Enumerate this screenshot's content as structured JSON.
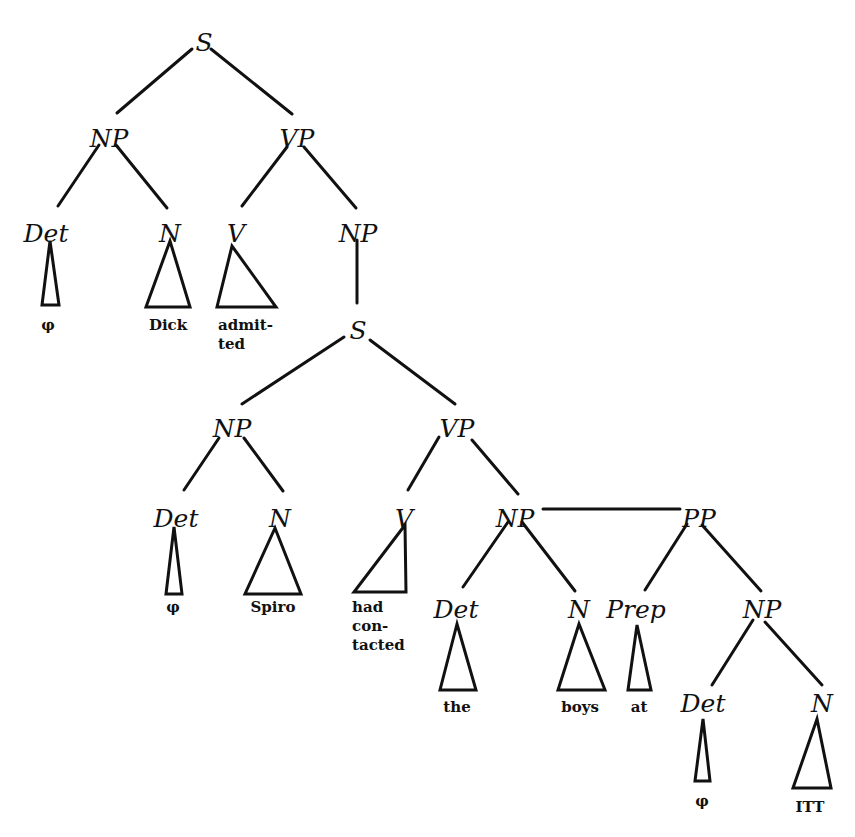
{
  "diagram": {
    "type": "syntax-tree",
    "sentence": "Dick admitted Spiro had contacted the boys at ITT",
    "colors": {
      "ink": "#111111",
      "background": "#ffffff"
    },
    "nodes": [
      {
        "id": "s1",
        "label": "S",
        "x": 204,
        "y": 42
      },
      {
        "id": "np1",
        "label": "NP",
        "x": 109,
        "y": 138
      },
      {
        "id": "vp1",
        "label": "VP",
        "x": 297,
        "y": 138
      },
      {
        "id": "det1",
        "label": "Det",
        "x": 46,
        "y": 233
      },
      {
        "id": "n1",
        "label": "N",
        "x": 170,
        "y": 233
      },
      {
        "id": "v1",
        "label": "V",
        "x": 236,
        "y": 233
      },
      {
        "id": "np2",
        "label": "NP",
        "x": 358,
        "y": 233
      },
      {
        "id": "s2",
        "label": "S",
        "x": 358,
        "y": 330
      },
      {
        "id": "np3",
        "label": "NP",
        "x": 232,
        "y": 428
      },
      {
        "id": "vp2",
        "label": "VP",
        "x": 457,
        "y": 428
      },
      {
        "id": "det2",
        "label": "Det",
        "x": 176,
        "y": 518
      },
      {
        "id": "n2",
        "label": "N",
        "x": 280,
        "y": 518
      },
      {
        "id": "v2",
        "label": "V",
        "x": 404,
        "y": 518
      },
      {
        "id": "np4",
        "label": "NP",
        "x": 515,
        "y": 518
      },
      {
        "id": "pp1",
        "label": "PP",
        "x": 699,
        "y": 518
      },
      {
        "id": "det3",
        "label": "Det",
        "x": 456,
        "y": 609
      },
      {
        "id": "n3",
        "label": "N",
        "x": 579,
        "y": 609
      },
      {
        "id": "prep1",
        "label": "Prep",
        "x": 636,
        "y": 609
      },
      {
        "id": "np5",
        "label": "NP",
        "x": 762,
        "y": 609
      },
      {
        "id": "det4",
        "label": "Det",
        "x": 703,
        "y": 703
      },
      {
        "id": "n4",
        "label": "N",
        "x": 822,
        "y": 703
      }
    ],
    "edges": [
      {
        "from": "s1",
        "to": "np1",
        "x1": 192,
        "y1": 49,
        "x2": 117,
        "y2": 113
      },
      {
        "from": "s1",
        "to": "vp1",
        "x1": 211,
        "y1": 49,
        "x2": 292,
        "y2": 114
      },
      {
        "from": "np1",
        "to": "det1",
        "x1": 99,
        "y1": 145,
        "x2": 58,
        "y2": 206
      },
      {
        "from": "np1",
        "to": "n1",
        "x1": 116,
        "y1": 145,
        "x2": 167,
        "y2": 208
      },
      {
        "from": "vp1",
        "to": "v1",
        "x1": 287,
        "y1": 147,
        "x2": 242,
        "y2": 206
      },
      {
        "from": "vp1",
        "to": "np2",
        "x1": 304,
        "y1": 147,
        "x2": 356,
        "y2": 208
      },
      {
        "from": "np2",
        "to": "s2",
        "x1": 357,
        "y1": 240,
        "x2": 357,
        "y2": 303
      },
      {
        "from": "s2",
        "to": "np3",
        "x1": 344,
        "y1": 337,
        "x2": 242,
        "y2": 404
      },
      {
        "from": "s2",
        "to": "vp2",
        "x1": 370,
        "y1": 340,
        "x2": 455,
        "y2": 404
      },
      {
        "from": "np3",
        "to": "det2",
        "x1": 219,
        "y1": 438,
        "x2": 184,
        "y2": 490
      },
      {
        "from": "np3",
        "to": "n2",
        "x1": 244,
        "y1": 438,
        "x2": 283,
        "y2": 491
      },
      {
        "from": "vp2",
        "to": "v2",
        "x1": 439,
        "y1": 437,
        "x2": 408,
        "y2": 490
      },
      {
        "from": "vp2",
        "to": "np4",
        "x1": 472,
        "y1": 440,
        "x2": 518,
        "y2": 494
      },
      {
        "from": "np4",
        "to": "pp1",
        "x1": 543,
        "y1": 509,
        "x2": 680,
        "y2": 509
      },
      {
        "from": "np4",
        "to": "det3",
        "x1": 508,
        "y1": 522,
        "x2": 463,
        "y2": 587
      },
      {
        "from": "np4",
        "to": "n3",
        "x1": 522,
        "y1": 522,
        "x2": 575,
        "y2": 591
      },
      {
        "from": "pp1",
        "to": "prep1",
        "x1": 687,
        "y1": 524,
        "x2": 645,
        "y2": 590
      },
      {
        "from": "pp1",
        "to": "np5",
        "x1": 702,
        "y1": 525,
        "x2": 761,
        "y2": 591
      },
      {
        "from": "np5",
        "to": "det4",
        "x1": 753,
        "y1": 620,
        "x2": 712,
        "y2": 685
      },
      {
        "from": "np5",
        "to": "n4",
        "x1": 765,
        "y1": 622,
        "x2": 822,
        "y2": 685
      }
    ],
    "leaves": [
      {
        "parent": "det1",
        "triangle": [
          [
            50,
            241
          ],
          [
            42,
            305
          ],
          [
            59,
            305
          ]
        ],
        "lines": [
          {
            "text": "φ",
            "x": 48,
            "y": 330
          }
        ]
      },
      {
        "parent": "n1",
        "triangle": [
          [
            170,
            241
          ],
          [
            146,
            307
          ],
          [
            190,
            307
          ]
        ],
        "lines": [
          {
            "text": "Dick",
            "x": 168,
            "y": 330
          }
        ]
      },
      {
        "parent": "v1",
        "triangle": [
          [
            232,
            246
          ],
          [
            217,
            307
          ],
          [
            276,
            307
          ]
        ],
        "lines": [
          {
            "text": "admit-",
            "x": 218,
            "y": 330,
            "anchor": "start"
          },
          {
            "text": "ted",
            "x": 218,
            "y": 349,
            "anchor": "start"
          }
        ]
      },
      {
        "parent": "det2",
        "triangle": [
          [
            174,
            527
          ],
          [
            166,
            594
          ],
          [
            182,
            594
          ]
        ],
        "lines": [
          {
            "text": "φ",
            "x": 173,
            "y": 612
          }
        ]
      },
      {
        "parent": "n2",
        "triangle": [
          [
            275,
            528
          ],
          [
            245,
            594
          ],
          [
            301,
            594
          ]
        ],
        "lines": [
          {
            "text": "Spiro",
            "x": 273,
            "y": 612
          }
        ]
      },
      {
        "parent": "v2",
        "triangle": [
          [
            405,
            525
          ],
          [
            354,
            592
          ],
          [
            406,
            592
          ]
        ],
        "lines": [
          {
            "text": "had",
            "x": 352,
            "y": 612,
            "anchor": "start"
          },
          {
            "text": "con-",
            "x": 352,
            "y": 631,
            "anchor": "start"
          },
          {
            "text": "tacted",
            "x": 352,
            "y": 650,
            "anchor": "start"
          }
        ]
      },
      {
        "parent": "det3",
        "triangle": [
          [
            457,
            624
          ],
          [
            440,
            690
          ],
          [
            476,
            690
          ]
        ],
        "lines": [
          {
            "text": "the",
            "x": 457,
            "y": 712
          }
        ]
      },
      {
        "parent": "n3",
        "triangle": [
          [
            579,
            624
          ],
          [
            558,
            690
          ],
          [
            605,
            690
          ]
        ],
        "lines": [
          {
            "text": "boys",
            "x": 580,
            "y": 712
          }
        ]
      },
      {
        "parent": "prep1",
        "triangle": [
          [
            637,
            625
          ],
          [
            628,
            690
          ],
          [
            651,
            690
          ]
        ],
        "lines": [
          {
            "text": "at",
            "x": 639,
            "y": 712
          }
        ]
      },
      {
        "parent": "det4",
        "triangle": [
          [
            703,
            719
          ],
          [
            695,
            781
          ],
          [
            710,
            781
          ]
        ],
        "lines": [
          {
            "text": "φ",
            "x": 702,
            "y": 806
          }
        ]
      },
      {
        "parent": "n4",
        "triangle": [
          [
            817,
            719
          ],
          [
            793,
            788
          ],
          [
            831,
            788
          ]
        ],
        "lines": [
          {
            "text": "ITT",
            "x": 810,
            "y": 812
          }
        ]
      }
    ]
  }
}
